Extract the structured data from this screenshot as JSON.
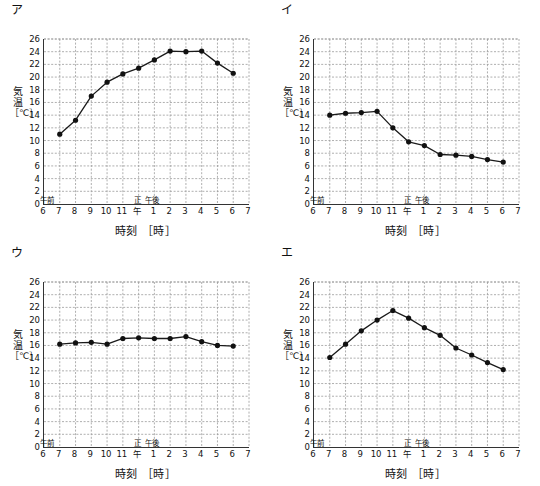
{
  "figure": {
    "panel_count": 4,
    "axis_caption_x": "時刻 ［時］",
    "axis_caption_y_1": "気",
    "axis_caption_y_2": "温",
    "axis_caption_y_3": "［℃］",
    "am_label": "午前",
    "noon_label_1": "正",
    "noon_label_2": "午",
    "pm_label": "午後",
    "y_ticks": [
      "0",
      "2",
      "4",
      "6",
      "8",
      "10",
      "12",
      "14",
      "16",
      "18",
      "20",
      "22",
      "24",
      "26"
    ],
    "x_ticks": [
      "6",
      "7",
      "8",
      "9",
      "10",
      "11",
      "",
      "1",
      "2",
      "3",
      "4",
      "5",
      "6",
      "7"
    ],
    "line_color": "#1a1a1a",
    "marker_color": "#111111",
    "grid_color": "#9a9a9a",
    "axis_color": "#333333"
  },
  "chart_data": [
    {
      "type": "line",
      "panel_label": "ア",
      "title": "ア",
      "xlabel": "時刻 ［時］",
      "ylabel": "気温 ［℃］",
      "ylim": [
        0,
        26
      ],
      "xlim": [
        6,
        19
      ],
      "grid": true,
      "legend": "none",
      "x": [
        7,
        8,
        9,
        10,
        11,
        12,
        13,
        14,
        15,
        16,
        17,
        18
      ],
      "x_tick_labels": [
        "午前6",
        "7",
        "8",
        "9",
        "10",
        "11",
        "正午",
        "午後1",
        "2",
        "3",
        "4",
        "5",
        "6",
        "7"
      ],
      "categories": [
        "7",
        "8",
        "9",
        "10",
        "11",
        "正午",
        "1",
        "2",
        "3",
        "4",
        "5",
        "6"
      ],
      "values": [
        11.0,
        13.2,
        17.0,
        19.2,
        20.5,
        21.4,
        22.7,
        24.1,
        24.0,
        24.1,
        22.2,
        20.6
      ]
    },
    {
      "type": "line",
      "panel_label": "イ",
      "title": "イ",
      "xlabel": "時刻 ［時］",
      "ylabel": "気温 ［℃］",
      "ylim": [
        0,
        26
      ],
      "xlim": [
        6,
        19
      ],
      "grid": true,
      "legend": "none",
      "x": [
        7,
        8,
        9,
        10,
        11,
        12,
        13,
        14,
        15,
        16,
        17,
        18
      ],
      "categories": [
        "7",
        "8",
        "9",
        "10",
        "11",
        "正午",
        "1",
        "2",
        "3",
        "4",
        "5",
        "6"
      ],
      "values": [
        14.0,
        14.3,
        14.4,
        14.6,
        12.0,
        9.8,
        9.2,
        7.8,
        7.7,
        7.5,
        7.0,
        6.6
      ]
    },
    {
      "type": "line",
      "panel_label": "ウ",
      "title": "ウ",
      "xlabel": "時刻 ［時］",
      "ylabel": "気温 ［℃］",
      "ylim": [
        0,
        26
      ],
      "xlim": [
        6,
        19
      ],
      "grid": true,
      "legend": "none",
      "x": [
        7,
        8,
        9,
        10,
        11,
        12,
        13,
        14,
        15,
        16,
        17,
        18
      ],
      "categories": [
        "7",
        "8",
        "9",
        "10",
        "11",
        "正午",
        "1",
        "2",
        "3",
        "4",
        "5",
        "6"
      ],
      "values": [
        16.2,
        16.4,
        16.5,
        16.2,
        17.1,
        17.2,
        17.1,
        17.1,
        17.4,
        16.6,
        16.0,
        15.9
      ]
    },
    {
      "type": "line",
      "panel_label": "エ",
      "title": "エ",
      "xlabel": "時刻 ［時］",
      "ylabel": "気温 ［℃］",
      "ylim": [
        0,
        26
      ],
      "xlim": [
        6,
        19
      ],
      "grid": true,
      "legend": "none",
      "x": [
        7,
        8,
        9,
        10,
        11,
        12,
        13,
        14,
        15,
        16,
        17,
        18
      ],
      "categories": [
        "7",
        "8",
        "9",
        "10",
        "11",
        "正午",
        "1",
        "2",
        "3",
        "4",
        "5",
        "6"
      ],
      "values": [
        14.1,
        16.2,
        18.3,
        20.0,
        21.5,
        20.3,
        18.8,
        17.6,
        15.6,
        14.5,
        13.3,
        12.2
      ]
    }
  ]
}
